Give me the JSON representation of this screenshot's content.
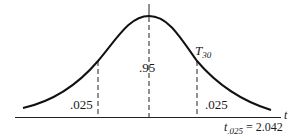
{
  "diagram": {
    "type": "t-distribution density curve",
    "curve_label": "T",
    "curve_label_sub": "30",
    "center_area": ".95",
    "left_tail_area": ".025",
    "right_tail_area": ".025",
    "axis_label": "t",
    "critical_value_label": "t",
    "critical_value_sub": ".025",
    "critical_value_eq": " = 2.042"
  }
}
